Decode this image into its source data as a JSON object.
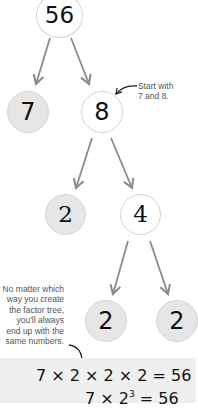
{
  "colors": {
    "arrow": "#8a8a8a",
    "prime_fill": "#e6e6e6",
    "composite_fill": "#ffffff",
    "circle_stroke": "#d2d2d2",
    "band": "#efefef",
    "annotation_text": "#555555"
  },
  "tree": {
    "root": {
      "value": "56",
      "type": "composite"
    },
    "level1": [
      {
        "value": "7",
        "type": "prime"
      },
      {
        "value": "8",
        "type": "composite"
      }
    ],
    "level2": [
      {
        "value": "2",
        "type": "prime"
      },
      {
        "value": "4",
        "type": "composite"
      }
    ],
    "level3": [
      {
        "value": "2",
        "type": "prime"
      },
      {
        "value": "2",
        "type": "prime"
      }
    ]
  },
  "annotations": {
    "start": {
      "line1": "Start with",
      "line2": "7 and 8."
    },
    "conclusion": {
      "line1": "No matter which",
      "line2": "way you create",
      "line3": "the factor tree,",
      "line4": "you'll always",
      "line5": "end up with the",
      "line6": "same numbers."
    }
  },
  "result": {
    "equation1": "7 × 2 × 2 × 2 = 56",
    "equation2_base": "7 × 2",
    "equation2_exponent": "3",
    "equation2_rest": " = 56"
  }
}
